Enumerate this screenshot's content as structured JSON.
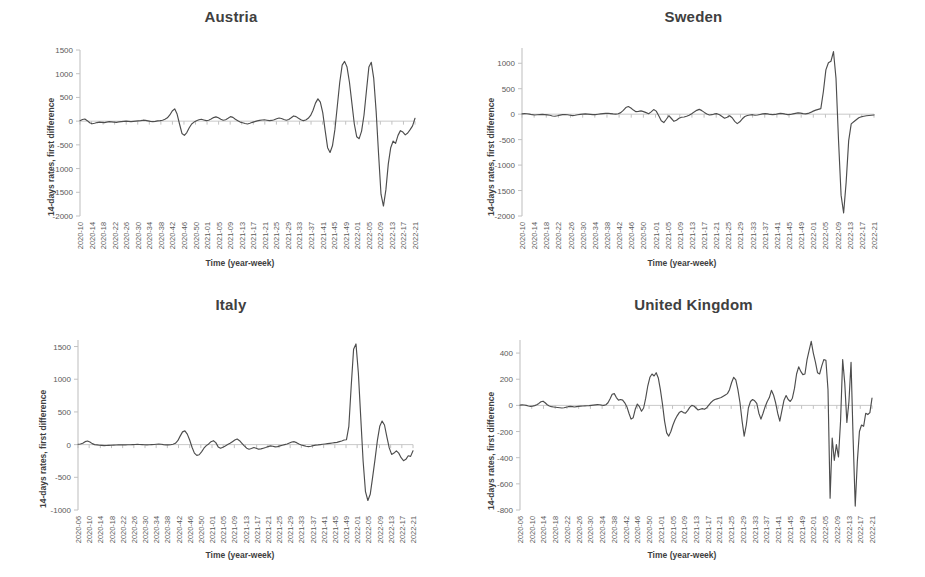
{
  "figure": {
    "panels": [
      "austria",
      "sweden",
      "italy",
      "united_kingdom"
    ],
    "line_color": "#4d4d4d",
    "axis_color": "#bdbdbd",
    "title_color": "#404040",
    "background": "#ffffff"
  },
  "axis_titles": {
    "x": "Time (year-week)",
    "y": "14-days rates, first difference"
  },
  "chart_data": [
    {
      "id": "austria",
      "type": "line",
      "title": "Austria",
      "xlabel": "Time (year-week)",
      "ylabel": "14-days rates, first difference",
      "ylim": [
        -2000,
        1500
      ],
      "yticks": [
        1500,
        1000,
        500,
        0,
        -500,
        -1000,
        -1500,
        -2000
      ],
      "grid": false,
      "legend": "none",
      "x_start": "2020-10",
      "x_end": "2022-21",
      "x_step_weeks": 4,
      "xticks": [
        "2020-10",
        "2020-14",
        "2020-18",
        "2020-22",
        "2020-26",
        "2020-30",
        "2020-34",
        "2020-38",
        "2020-42",
        "2020-46",
        "2020-50",
        "2021-01",
        "2021-05",
        "2021-09",
        "2021-13",
        "2021-17",
        "2021-21",
        "2021-25",
        "2021-29",
        "2021-33",
        "2021-37",
        "2021-41",
        "2021-45",
        "2021-49",
        "2022-01",
        "2022-05",
        "2022-09",
        "2022-13",
        "2022-17",
        "2022-21"
      ],
      "values": [
        10,
        35,
        45,
        10,
        -35,
        -55,
        -45,
        -30,
        -20,
        -25,
        -30,
        -20,
        -10,
        -15,
        -20,
        -25,
        -15,
        -10,
        -5,
        0,
        -5,
        -10,
        -5,
        0,
        5,
        10,
        20,
        15,
        5,
        -5,
        -10,
        -5,
        5,
        10,
        20,
        40,
        70,
        130,
        215,
        260,
        150,
        -60,
        -260,
        -300,
        -240,
        -140,
        -60,
        -20,
        10,
        30,
        40,
        25,
        10,
        20,
        45,
        75,
        90,
        70,
        40,
        20,
        30,
        60,
        95,
        80,
        40,
        10,
        -20,
        -35,
        -50,
        -60,
        -45,
        -25,
        -10,
        5,
        15,
        25,
        30,
        20,
        10,
        15,
        30,
        50,
        65,
        55,
        35,
        20,
        35,
        70,
        110,
        95,
        60,
        30,
        10,
        25,
        60,
        120,
        230,
        380,
        470,
        400,
        180,
        -200,
        -560,
        -660,
        -520,
        -180,
        320,
        820,
        1180,
        1260,
        1140,
        820,
        380,
        -60,
        -330,
        -370,
        -210,
        130,
        640,
        1140,
        1240,
        900,
        200,
        -700,
        -1540,
        -1790,
        -1450,
        -900,
        -560,
        -420,
        -470,
        -300,
        -200,
        -230,
        -290,
        -250,
        -180,
        -100,
        60
      ]
    },
    {
      "id": "sweden",
      "type": "line",
      "title": "Sweden",
      "xlabel": "Time (year-week)",
      "ylabel": "14-days rates, first difference",
      "ylim": [
        -2000,
        1300
      ],
      "yticks": [
        1000,
        500,
        0,
        -500,
        -1000,
        -1500,
        -2000
      ],
      "grid": false,
      "legend": "none",
      "x_start": "2020-10",
      "x_end": "2022-21",
      "x_step_weeks": 4,
      "xticks": [
        "2020-10",
        "2020-14",
        "2020-18",
        "2020-22",
        "2020-26",
        "2020-30",
        "2020-34",
        "2020-38",
        "2020-42",
        "2020-46",
        "2020-50",
        "2021-01",
        "2021-05",
        "2021-09",
        "2021-13",
        "2021-17",
        "2021-21",
        "2021-25",
        "2021-29",
        "2021-33",
        "2021-37",
        "2021-41",
        "2021-45",
        "2021-49",
        "2022-01",
        "2022-05",
        "2022-09",
        "2022-13",
        "2022-17",
        "2022-21"
      ],
      "values": [
        5,
        12,
        8,
        0,
        -10,
        -15,
        -12,
        -8,
        -5,
        -8,
        -14,
        -20,
        -35,
        -40,
        -30,
        -18,
        -10,
        -8,
        -12,
        -20,
        -28,
        -22,
        -12,
        -5,
        0,
        5,
        2,
        -4,
        -10,
        -8,
        -2,
        5,
        10,
        15,
        18,
        12,
        5,
        0,
        8,
        30,
        75,
        130,
        150,
        120,
        80,
        50,
        55,
        65,
        50,
        30,
        10,
        45,
        90,
        60,
        -30,
        -130,
        -165,
        -100,
        -30,
        -85,
        -140,
        -120,
        -80,
        -60,
        -55,
        -40,
        -20,
        10,
        45,
        75,
        95,
        70,
        35,
        5,
        -15,
        -10,
        5,
        10,
        -10,
        -45,
        -80,
        -60,
        -30,
        -70,
        -140,
        -185,
        -150,
        -90,
        -45,
        -25,
        -15,
        -10,
        -20,
        -15,
        -5,
        5,
        10,
        5,
        -5,
        -10,
        -5,
        5,
        15,
        10,
        0,
        -8,
        -5,
        5,
        15,
        25,
        20,
        10,
        5,
        15,
        35,
        60,
        80,
        95,
        110,
        440,
        870,
        1010,
        1040,
        1230,
        700,
        -520,
        -1590,
        -1940,
        -1340,
        -520,
        -190,
        -150,
        -110,
        -70,
        -50,
        -40,
        -30,
        -25,
        -20,
        -15
      ]
    },
    {
      "id": "italy",
      "type": "line",
      "title": "Italy",
      "xlabel": "Time (year-week)",
      "ylabel": "14-days rates, first difference",
      "ylim": [
        -1000,
        1600
      ],
      "yticks": [
        1500,
        1000,
        500,
        0,
        -500,
        -1000
      ],
      "grid": false,
      "legend": "none",
      "x_start": "2020-06",
      "x_end": "2022-21",
      "x_step_weeks": 4,
      "xticks": [
        "2020-06",
        "2020-10",
        "2020-14",
        "2020-18",
        "2020-22",
        "2020-26",
        "2020-30",
        "2020-34",
        "2020-38",
        "2020-42",
        "2020-46",
        "2020-50",
        "2021-01",
        "2021-05",
        "2021-09",
        "2021-13",
        "2021-17",
        "2021-21",
        "2021-25",
        "2021-29",
        "2021-33",
        "2021-37",
        "2021-41",
        "2021-45",
        "2021-49",
        "2022-01",
        "2022-05",
        "2022-09",
        "2022-13",
        "2022-17",
        "2022-21"
      ],
      "values": [
        5,
        10,
        20,
        45,
        55,
        40,
        15,
        0,
        -5,
        -10,
        -12,
        -15,
        -14,
        -12,
        -10,
        -8,
        -6,
        -5,
        -5,
        -4,
        -3,
        -2,
        -2,
        0,
        2,
        3,
        2,
        0,
        -2,
        -3,
        -2,
        0,
        2,
        5,
        8,
        5,
        0,
        -3,
        -5,
        -2,
        5,
        20,
        60,
        130,
        195,
        210,
        160,
        70,
        -40,
        -130,
        -165,
        -155,
        -110,
        -55,
        -15,
        10,
        45,
        60,
        30,
        -35,
        -55,
        -40,
        -20,
        0,
        20,
        45,
        70,
        85,
        60,
        20,
        -20,
        -55,
        -70,
        -60,
        -45,
        -55,
        -70,
        -65,
        -55,
        -45,
        -30,
        -20,
        -25,
        -35,
        -30,
        -20,
        -10,
        0,
        10,
        25,
        40,
        45,
        30,
        10,
        -5,
        -15,
        -25,
        -30,
        -25,
        -15,
        -8,
        -5,
        0,
        5,
        10,
        15,
        20,
        25,
        30,
        35,
        45,
        55,
        70,
        75,
        280,
        900,
        1460,
        1540,
        1100,
        420,
        -250,
        -720,
        -855,
        -760,
        -500,
        -230,
        60,
        280,
        360,
        300,
        120,
        -50,
        -150,
        -130,
        -95,
        -130,
        -200,
        -245,
        -225,
        -170,
        -180,
        -95
      ]
    },
    {
      "id": "united_kingdom",
      "type": "line",
      "title": "United Kingdom",
      "xlabel": "Time (year-week)",
      "ylabel": "14-days rates, first difference",
      "ylim": [
        -800,
        500
      ],
      "yticks": [
        400,
        200,
        0,
        -200,
        -400,
        -600,
        -800
      ],
      "grid": false,
      "legend": "none",
      "x_start": "2020-06",
      "x_end": "2022-21",
      "x_step_weeks": 4,
      "xticks": [
        "2020-06",
        "2020-10",
        "2020-14",
        "2020-18",
        "2020-22",
        "2020-26",
        "2020-30",
        "2020-34",
        "2020-38",
        "2020-42",
        "2020-46",
        "2020-50",
        "2021-01",
        "2021-05",
        "2021-09",
        "2021-13",
        "2021-17",
        "2021-21",
        "2021-25",
        "2021-29",
        "2021-33",
        "2021-37",
        "2021-41",
        "2021-45",
        "2021-49",
        "2022-01",
        "2022-05",
        "2022-09",
        "2022-13",
        "2022-17",
        "2022-21"
      ],
      "values": [
        2,
        4,
        3,
        0,
        -5,
        -8,
        -6,
        -2,
        5,
        15,
        28,
        32,
        20,
        5,
        -5,
        -10,
        -12,
        -14,
        -16,
        -18,
        -20,
        -18,
        -14,
        -10,
        -8,
        -10,
        -12,
        -10,
        -8,
        -6,
        -5,
        -4,
        -3,
        -2,
        0,
        2,
        4,
        6,
        5,
        2,
        0,
        5,
        20,
        50,
        85,
        90,
        60,
        40,
        45,
        40,
        20,
        -10,
        -60,
        -105,
        -95,
        -30,
        10,
        -10,
        -45,
        -20,
        55,
        150,
        215,
        240,
        225,
        250,
        210,
        120,
        10,
        -120,
        -210,
        -235,
        -200,
        -150,
        -110,
        -80,
        -55,
        -45,
        -55,
        -60,
        -40,
        -15,
        0,
        -5,
        -20,
        -35,
        -30,
        -25,
        -30,
        -20,
        0,
        20,
        35,
        45,
        50,
        55,
        60,
        70,
        80,
        90,
        120,
        175,
        215,
        195,
        120,
        20,
        -120,
        -235,
        -150,
        -20,
        30,
        45,
        35,
        15,
        -60,
        -105,
        -60,
        -10,
        30,
        60,
        115,
        80,
        20,
        -60,
        -120,
        -40,
        40,
        75,
        45,
        30,
        55,
        130,
        240,
        295,
        260,
        235,
        240,
        350,
        420,
        490,
        400,
        330,
        250,
        240,
        300,
        350,
        345,
        120,
        -710,
        -250,
        -420,
        -300,
        -395,
        -120,
        350,
        170,
        -130,
        30,
        330,
        -260,
        -770,
        -430,
        -200,
        -150,
        -160,
        -60,
        -70,
        -55,
        55
      ]
    }
  ]
}
